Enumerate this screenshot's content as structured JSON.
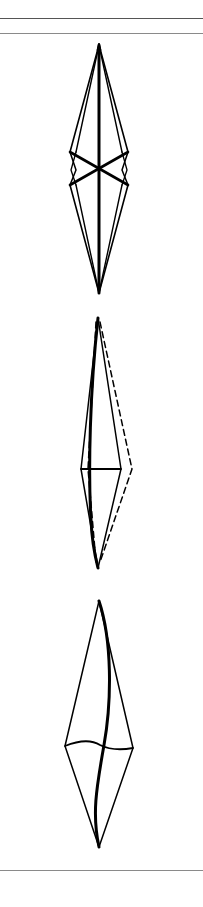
{
  "figure": {
    "panels": [
      {
        "id": "panel-1",
        "style": "double-sided kite with thick central axis and crossing diagonal braces"
      },
      {
        "id": "panel-2",
        "style": "kite with solid and dashed outlines, curved thick axis and horizontal cross bar"
      },
      {
        "id": "panel-3",
        "style": "single kite with S-curved thick axis and wavy horizontal cross line"
      }
    ],
    "colors": {
      "stroke": "#000000",
      "background": "#ffffff",
      "rule": "#8a8a8a"
    }
  }
}
